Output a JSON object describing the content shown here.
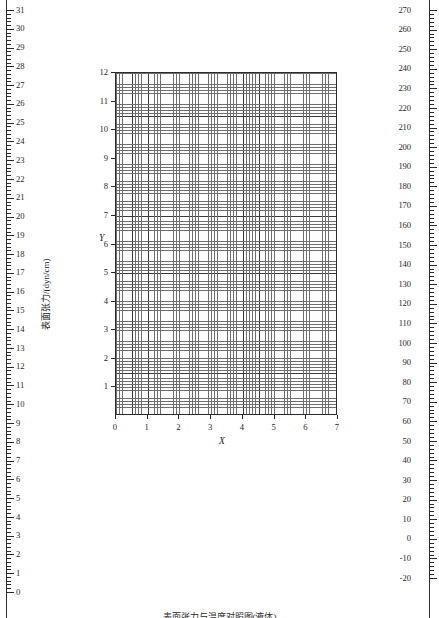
{
  "figure": {
    "caption": "表面张力与温度对照图(液体)"
  },
  "left_axis": {
    "name": "surface-tension-axis",
    "title": "表面张力/(dyn/cm)",
    "unit": "dyn/cm",
    "min": 0,
    "max": 31,
    "major_step": 1,
    "minor_per_major": 5,
    "labels": [
      "31",
      "30",
      "29",
      "28",
      "27",
      "26",
      "25",
      "24",
      "23",
      "22",
      "21",
      "20",
      "19",
      "18",
      "17",
      "16",
      "15",
      "14",
      "13",
      "12",
      "11",
      "10",
      "9",
      "8",
      "7",
      "6",
      "5",
      "4",
      "3",
      "2",
      "1",
      "0"
    ]
  },
  "right_axis": {
    "name": "temperature-axis",
    "title": "温度/℃",
    "unit": "℃",
    "min": -20,
    "max": 270,
    "major_step": 10,
    "minor_per_major": 5,
    "labels": [
      "270",
      "260",
      "250",
      "240",
      "230",
      "220",
      "210",
      "200",
      "190",
      "180",
      "170",
      "160",
      "150",
      "140",
      "130",
      "120",
      "110",
      "100",
      "90",
      "80",
      "70",
      "60",
      "50",
      "40",
      "30",
      "20",
      "10",
      "0",
      "-10",
      "-20"
    ]
  },
  "plot": {
    "x_axis_title": "X",
    "y_axis_title": "Y",
    "x_labels": [
      "0",
      "1",
      "2",
      "3",
      "4",
      "5",
      "6",
      "7"
    ],
    "y_labels": [
      "1",
      "2",
      "3",
      "4",
      "5",
      "6",
      "7",
      "8",
      "9",
      "10",
      "11",
      "12"
    ],
    "grid": "graph-paper"
  },
  "chart_data": {
    "type": "line",
    "title": "表面张力与温度对照图(液体)",
    "xlabel": "X",
    "ylabel": "Y",
    "xlim": [
      0,
      7
    ],
    "ylim": [
      0,
      12
    ],
    "x_ticks": [
      0,
      1,
      2,
      3,
      4,
      5,
      6,
      7
    ],
    "y_ticks": [
      1,
      2,
      3,
      4,
      5,
      6,
      7,
      8,
      9,
      10,
      11,
      12
    ],
    "grid": true,
    "legend": "none",
    "series": [],
    "auxiliary_axes": [
      {
        "name": "表面张力/(dyn/cm)",
        "position": "left-outer",
        "lim": [
          0,
          31
        ],
        "ticks": [
          0,
          1,
          2,
          3,
          4,
          5,
          6,
          7,
          8,
          9,
          10,
          11,
          12,
          13,
          14,
          15,
          16,
          17,
          18,
          19,
          20,
          21,
          22,
          23,
          24,
          25,
          26,
          27,
          28,
          29,
          30,
          31
        ],
        "minor_subdivisions": 5
      },
      {
        "name": "温度/℃",
        "position": "right-outer",
        "lim": [
          -20,
          270
        ],
        "ticks": [
          -20,
          -10,
          0,
          10,
          20,
          30,
          40,
          50,
          60,
          70,
          80,
          90,
          100,
          110,
          120,
          130,
          140,
          150,
          160,
          170,
          180,
          190,
          200,
          210,
          220,
          230,
          240,
          250,
          260,
          270
        ],
        "minor_subdivisions": 5
      }
    ]
  },
  "colors": {
    "ink": "#1a1a1a",
    "axis": "#2b2b2b",
    "grid_minor": "#6e6e6e",
    "grid_major": "#3a3a3a",
    "paper": "#ffffff"
  }
}
